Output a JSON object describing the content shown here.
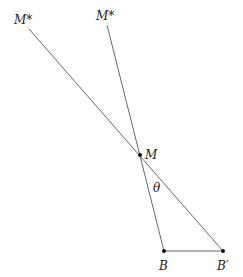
{
  "diagram": {
    "type": "geometry",
    "background": "#ffffff",
    "line_color": "#555555",
    "text_color": "#222222",
    "points": {
      "M": {
        "label": "M",
        "x": 140,
        "y": 155
      },
      "B": {
        "label": "B",
        "x": 164,
        "y": 251
      },
      "B_prime": {
        "label": "B′",
        "x": 223,
        "y": 251
      },
      "M_star_left": {
        "label": "M*",
        "x": 29,
        "y": 29
      },
      "M_star_right": {
        "label": "M*",
        "x": 107,
        "y": 25
      }
    },
    "segments": [
      {
        "from": "M_star_left",
        "to": "B_prime"
      },
      {
        "from": "M_star_right",
        "to": "B"
      },
      {
        "from": "B",
        "to": "B_prime"
      }
    ],
    "angle": {
      "label": "θ",
      "vertex": "M",
      "between": [
        "M-B",
        "M-B′"
      ]
    },
    "labels": {
      "m_star_left": "M*",
      "m_star_right": "M*",
      "m": "M",
      "theta": "θ",
      "b": "B",
      "b_prime": "B′"
    }
  }
}
